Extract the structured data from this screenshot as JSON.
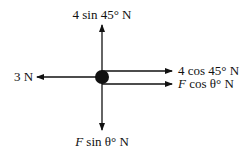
{
  "diagram": {
    "type": "free-body-diagram",
    "colors": {
      "stroke": "#111111",
      "background": "#ffffff"
    },
    "forces": {
      "up": {
        "label": "4 sin 45° N"
      },
      "left": {
        "label": "3 N"
      },
      "right_upper": {
        "label": "4 cos 45° N"
      },
      "right_lower": {
        "prefix": "F",
        "label": " cos θ° N"
      },
      "down": {
        "prefix": "F",
        "label": " sin θ° N"
      }
    }
  }
}
